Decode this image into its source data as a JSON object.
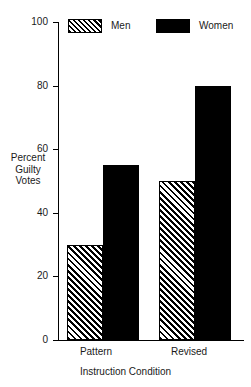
{
  "chart_data": {
    "type": "bar",
    "title": "",
    "subtitle": "",
    "categories": [
      "Pattern",
      "Revised"
    ],
    "series": [
      {
        "name": "Men",
        "values": [
          30,
          55
        ]
      },
      {
        "name": "Women",
        "values": [
          55,
          80
        ]
      }
    ],
    "xlabel": "Instruction Condition",
    "ylabel": "Percent Guilty Votes",
    "ylabel_lines": [
      "Percent",
      "Guilty",
      "Votes"
    ],
    "ylim": [
      0,
      100
    ],
    "yticks": [
      0,
      20,
      40,
      60,
      80,
      100
    ],
    "ytick_labels": [
      "0",
      "20",
      "40",
      "60",
      "80",
      "100"
    ],
    "grid": false,
    "legend_position": "top",
    "legend": [
      {
        "label": "Men",
        "fill": "diagonal-hatch"
      },
      {
        "label": "Women",
        "fill": "solid-black"
      }
    ],
    "colors": {
      "men": "#ffffff",
      "women": "#000000",
      "axis": "#000000",
      "text": "#1a1a1a",
      "background": "#ffffff"
    }
  },
  "bars": [
    {
      "group": "Pattern",
      "series": "Men",
      "value": 30
    },
    {
      "group": "Pattern",
      "series": "Women",
      "value": 55
    },
    {
      "group": "Revised",
      "series": "Men",
      "value": 50
    },
    {
      "group": "Revised",
      "series": "Women",
      "value": 80
    }
  ],
  "note_corrected_values": {
    "pattern_men": 30,
    "pattern_women": 55,
    "revised_men": 50,
    "revised_women": 80
  }
}
